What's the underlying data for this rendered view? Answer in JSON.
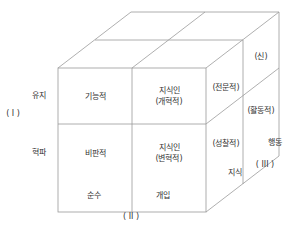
{
  "axes": {
    "axis1": {
      "label": "( I )",
      "levels": [
        "유지",
        "혁파"
      ]
    },
    "axis2": {
      "label": "( II )",
      "levels": [
        "순수",
        "개입"
      ]
    },
    "axis3": {
      "label": "( III )",
      "levels": [
        "지식",
        "행동"
      ]
    }
  },
  "front_cells": {
    "top_left": "기능적",
    "top_right_line1": "지식인",
    "top_right_line2": "(개혁적)",
    "bottom_left": "비판적",
    "bottom_right_line1": "지식인",
    "bottom_right_line2": "(변혁적)"
  },
  "side_cells": {
    "top_front": "(전문적)",
    "top_back": "(신)",
    "bottom_front": "(성찰적)",
    "bottom_back": "(활동적)"
  },
  "colors": {
    "line": "#9a9a9a",
    "text": "#333333"
  }
}
